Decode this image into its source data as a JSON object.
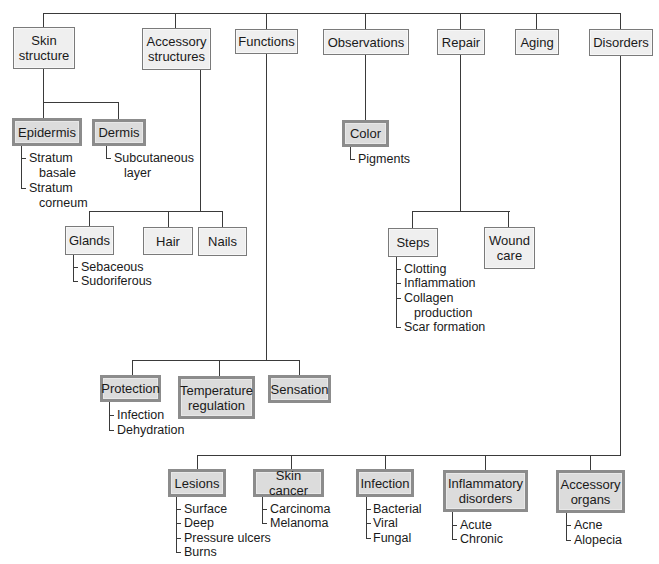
{
  "diagram": {
    "top_categories": [
      {
        "id": "skin-structure",
        "label": "Skin\nstructure",
        "line1": "Skin",
        "line2": "structure"
      },
      {
        "id": "accessory-structures",
        "line1": "Accessory",
        "line2": "structures"
      },
      {
        "id": "functions",
        "label": "Functions"
      },
      {
        "id": "observations",
        "label": "Observations"
      },
      {
        "id": "repair",
        "label": "Repair"
      },
      {
        "id": "aging",
        "label": "Aging"
      },
      {
        "id": "disorders",
        "label": "Disorders"
      }
    ],
    "skin_structure": {
      "children": [
        {
          "label": "Epidermis",
          "emphasized": true,
          "items": [
            "Stratum",
            "basale",
            "Stratum",
            "corneum"
          ],
          "item_list": [
            "Stratum basale",
            "Stratum corneum"
          ]
        },
        {
          "label": "Dermis",
          "emphasized": true,
          "items": [
            "Subcutaneous",
            "layer"
          ],
          "item_list": [
            "Subcutaneous layer"
          ]
        }
      ]
    },
    "accessory_structures": {
      "children": [
        {
          "label": "Glands",
          "items": [
            "Sebaceous",
            "Sudoriferous"
          ]
        },
        {
          "label": "Hair"
        },
        {
          "label": "Nails"
        }
      ]
    },
    "functions": {
      "children": [
        {
          "label": "Protection",
          "emphasized": true,
          "items": [
            "Infection",
            "Dehydration"
          ]
        },
        {
          "label": "Temperature regulation",
          "line1": "Temperature",
          "line2": "regulation",
          "emphasized": true
        },
        {
          "label": "Sensation",
          "emphasized": true
        }
      ]
    },
    "observations": {
      "children": [
        {
          "label": "Color",
          "emphasized": true,
          "items": [
            "Pigments"
          ]
        }
      ]
    },
    "repair": {
      "children": [
        {
          "label": "Steps",
          "items": [
            "Clotting",
            "Inflammation",
            "Collagen",
            "production",
            "Scar formation"
          ],
          "item_list": [
            "Clotting",
            "Inflammation",
            "Collagen production",
            "Scar formation"
          ]
        },
        {
          "label": "Wound care",
          "line1": "Wound",
          "line2": "care"
        }
      ]
    },
    "disorders": {
      "children": [
        {
          "label": "Lesions",
          "items": [
            "Surface",
            "Deep",
            "Pressure ulcers",
            "Burns"
          ]
        },
        {
          "label": "Skin cancer",
          "items": [
            "Carcinoma",
            "Melanoma"
          ]
        },
        {
          "label": "Infection",
          "items": [
            "Bacterial",
            "Viral",
            "Fungal"
          ]
        },
        {
          "label": "Inflammatory disorders",
          "line1": "Inflammatory",
          "line2": "disorders",
          "items": [
            "Acute",
            "Chronic"
          ]
        },
        {
          "label": "Accessory organs",
          "line1": "Accessory",
          "line2": "organs",
          "items": [
            "Acne",
            "Alopecia"
          ]
        }
      ]
    }
  },
  "colors": {
    "line": "#3a3a3a",
    "box_fill": "#efefef",
    "box_border": "#7a7a7a",
    "emphasized_fill": "#dcdcdc",
    "emphasized_border": "#8c8c8c"
  }
}
